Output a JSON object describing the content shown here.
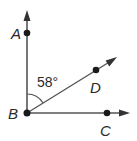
{
  "diagram": {
    "type": "angle-figure",
    "vertex": {
      "label": "B",
      "x": 27,
      "y": 113
    },
    "rays": [
      {
        "name": "BA",
        "through": {
          "label": "A",
          "x": 27,
          "y": 33
        },
        "tip": {
          "x": 27,
          "y": 12
        }
      },
      {
        "name": "BD",
        "through": {
          "label": "D",
          "x": 96,
          "y": 71
        },
        "tip": {
          "x": 116,
          "y": 58
        }
      },
      {
        "name": "BC",
        "through": {
          "label": "C",
          "x": 107,
          "y": 113
        },
        "tip": {
          "x": 129,
          "y": 113
        }
      }
    ],
    "angle_mark": {
      "between": [
        "BA",
        "BD"
      ],
      "label": "58°"
    },
    "labels": {
      "A": "A",
      "B": "B",
      "C": "C",
      "D": "D",
      "angle": "58°"
    },
    "colors": {
      "line": "#555555",
      "point": "#1a1a1a",
      "text": "#2a2a2a"
    }
  }
}
